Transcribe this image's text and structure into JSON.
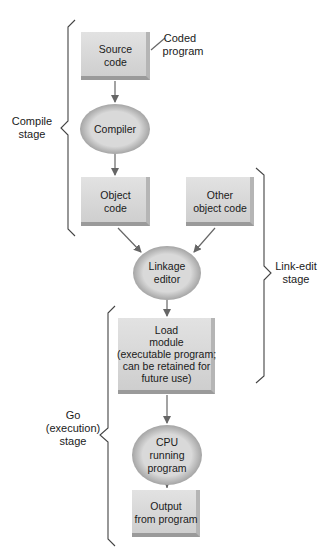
{
  "diagram": {
    "type": "flowchart",
    "colors": {
      "box_fill": "#d2d2d2",
      "box_highlight": "#e6e6e6",
      "box_shadow": "#9a9a9a",
      "ellipse_outer": "#a9a9a9",
      "ellipse_inner": "#d8d8d8",
      "line": "#555555",
      "text": "#1a1a1a"
    },
    "nodes": {
      "source_code": {
        "shape": "box",
        "lines": [
          "Source",
          "code"
        ]
      },
      "compiler": {
        "shape": "ellipse",
        "lines": [
          "Compiler"
        ]
      },
      "object_code": {
        "shape": "box",
        "lines": [
          "Object",
          "code"
        ]
      },
      "other_object_code": {
        "shape": "box",
        "lines": [
          "Other",
          "object code"
        ]
      },
      "linkage_editor": {
        "shape": "ellipse",
        "lines": [
          "Linkage",
          "editor"
        ]
      },
      "load_module": {
        "shape": "box",
        "lines": [
          "Load",
          "module",
          "(executable program;",
          "can be retained for",
          "future use)"
        ]
      },
      "cpu": {
        "shape": "ellipse",
        "lines": [
          "CPU",
          "running",
          "program"
        ]
      },
      "output": {
        "shape": "box",
        "lines": [
          "Output",
          "from program"
        ]
      }
    },
    "annotations": {
      "coded_program": [
        "Coded",
        "program"
      ]
    },
    "stages": {
      "compile": [
        "Compile",
        "stage"
      ],
      "link_edit": [
        "Link-edit",
        "stage"
      ],
      "go": [
        "Go",
        "(execution)",
        "stage"
      ]
    },
    "edges": [
      [
        "source_code",
        "compiler"
      ],
      [
        "compiler",
        "object_code"
      ],
      [
        "object_code",
        "linkage_editor"
      ],
      [
        "other_object_code",
        "linkage_editor"
      ],
      [
        "linkage_editor",
        "load_module"
      ],
      [
        "load_module",
        "cpu"
      ],
      [
        "cpu",
        "output"
      ]
    ]
  }
}
